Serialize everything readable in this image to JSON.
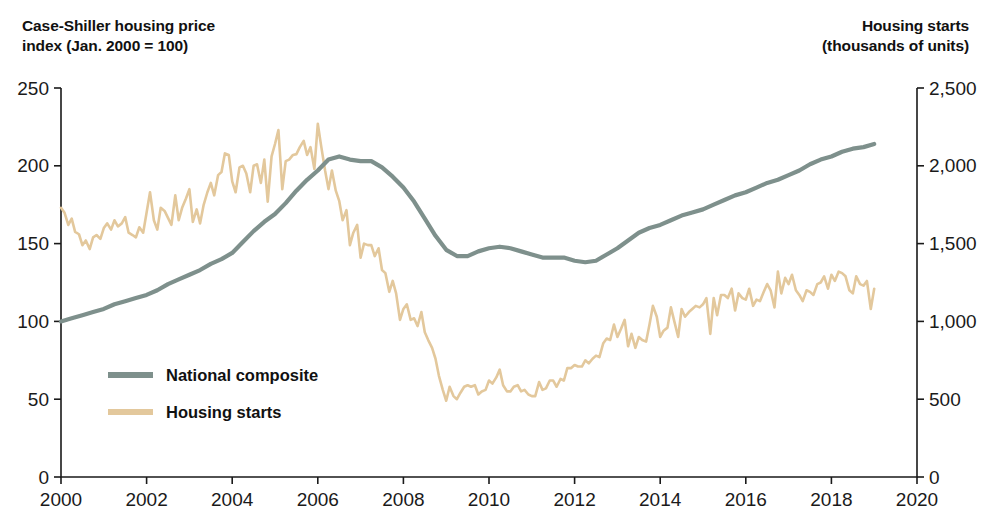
{
  "axis_titles": {
    "left": "Case-Shiller housing price\nindex (Jan. 2000 = 100)",
    "right": "Housing starts\n(thousands of units)"
  },
  "colors": {
    "national_composite": "#7e908c",
    "housing_starts": "#e3c89c",
    "axis": "#1a1a1a",
    "text": "#111111",
    "background": "#ffffff"
  },
  "legend": {
    "position": "inside-lower-left",
    "entries": [
      {
        "label": "National composite",
        "color": "#7e908c"
      },
      {
        "label": "Housing starts",
        "color": "#e3c89c"
      }
    ]
  },
  "chart_data": {
    "type": "line",
    "title": "",
    "subtitle": "",
    "xlabel": "",
    "grid": false,
    "xlim": [
      2000,
      2020
    ],
    "xticks": [
      2000,
      2002,
      2004,
      2006,
      2008,
      2010,
      2012,
      2014,
      2016,
      2018,
      2020
    ],
    "xticklabels": [
      "2000",
      "2002",
      "2004",
      "2006",
      "2008",
      "2010",
      "2012",
      "2014",
      "2016",
      "2018",
      "2020"
    ],
    "axes": [
      {
        "side": "left",
        "label": "Case-Shiller housing price index (Jan. 2000 = 100)",
        "ylim": [
          0,
          250
        ],
        "yticks": [
          0,
          50,
          100,
          150,
          200,
          250
        ],
        "yticklabels": [
          "0",
          "50",
          "100",
          "150",
          "200",
          "250"
        ]
      },
      {
        "side": "right",
        "label": "Housing starts (thousands of units)",
        "ylim": [
          0,
          2500
        ],
        "yticks": [
          0,
          500,
          1000,
          1500,
          2000,
          2500
        ],
        "yticklabels": [
          "0",
          "500",
          "1,000",
          "1,500",
          "2,000",
          "2,500"
        ]
      }
    ],
    "series": [
      {
        "name": "National composite",
        "axis": "left",
        "color": "#7e908c",
        "units": "index (Jan. 2000 = 100)",
        "x": [
          2000.0,
          2000.25,
          2000.5,
          2000.75,
          2001.0,
          2001.25,
          2001.5,
          2001.75,
          2002.0,
          2002.25,
          2002.5,
          2002.75,
          2003.0,
          2003.25,
          2003.5,
          2003.75,
          2004.0,
          2004.25,
          2004.5,
          2004.75,
          2005.0,
          2005.25,
          2005.5,
          2005.75,
          2006.0,
          2006.25,
          2006.5,
          2006.75,
          2007.0,
          2007.25,
          2007.5,
          2007.75,
          2008.0,
          2008.25,
          2008.5,
          2008.75,
          2009.0,
          2009.25,
          2009.5,
          2009.75,
          2010.0,
          2010.25,
          2010.5,
          2010.75,
          2011.0,
          2011.25,
          2011.5,
          2011.75,
          2012.0,
          2012.25,
          2012.5,
          2012.75,
          2013.0,
          2013.25,
          2013.5,
          2013.75,
          2014.0,
          2014.25,
          2014.5,
          2014.75,
          2015.0,
          2015.25,
          2015.5,
          2015.75,
          2016.0,
          2016.25,
          2016.5,
          2016.75,
          2017.0,
          2017.25,
          2017.5,
          2017.75,
          2018.0,
          2018.25,
          2018.5,
          2018.75,
          2019.0
        ],
        "y": [
          100,
          102,
          104,
          106,
          108,
          111,
          113,
          115,
          117,
          120,
          124,
          127,
          130,
          133,
          137,
          140,
          144,
          151,
          158,
          164,
          169,
          176,
          184,
          191,
          197,
          204,
          206,
          204,
          203,
          203,
          199,
          193,
          186,
          177,
          166,
          155,
          146,
          142,
          142,
          145,
          147,
          148,
          147,
          145,
          143,
          141,
          141,
          141,
          139,
          138,
          139,
          143,
          147,
          152,
          157,
          160,
          162,
          165,
          168,
          170,
          172,
          175,
          178,
          181,
          183,
          186,
          189,
          191,
          194,
          197,
          201,
          204,
          206,
          209,
          211,
          212,
          214
        ]
      },
      {
        "name": "Housing starts",
        "axis": "right",
        "color": "#e3c89c",
        "units": "thousands of units (SAAR, monthly)",
        "x": [
          2000.0,
          2000.08,
          2000.17,
          2000.25,
          2000.33,
          2000.42,
          2000.5,
          2000.58,
          2000.67,
          2000.75,
          2000.83,
          2000.92,
          2001.0,
          2001.08,
          2001.17,
          2001.25,
          2001.33,
          2001.42,
          2001.5,
          2001.58,
          2001.67,
          2001.75,
          2001.83,
          2001.92,
          2002.0,
          2002.08,
          2002.17,
          2002.25,
          2002.33,
          2002.42,
          2002.5,
          2002.58,
          2002.67,
          2002.75,
          2002.83,
          2002.92,
          2003.0,
          2003.08,
          2003.17,
          2003.25,
          2003.33,
          2003.42,
          2003.5,
          2003.58,
          2003.67,
          2003.75,
          2003.83,
          2003.92,
          2004.0,
          2004.08,
          2004.17,
          2004.25,
          2004.33,
          2004.42,
          2004.5,
          2004.58,
          2004.67,
          2004.75,
          2004.83,
          2004.92,
          2005.0,
          2005.08,
          2005.17,
          2005.25,
          2005.33,
          2005.42,
          2005.5,
          2005.58,
          2005.67,
          2005.75,
          2005.83,
          2005.92,
          2006.0,
          2006.08,
          2006.17,
          2006.25,
          2006.33,
          2006.42,
          2006.5,
          2006.58,
          2006.67,
          2006.75,
          2006.83,
          2006.92,
          2007.0,
          2007.08,
          2007.17,
          2007.25,
          2007.33,
          2007.42,
          2007.5,
          2007.58,
          2007.67,
          2007.75,
          2007.83,
          2007.92,
          2008.0,
          2008.08,
          2008.17,
          2008.25,
          2008.33,
          2008.42,
          2008.5,
          2008.58,
          2008.67,
          2008.75,
          2008.83,
          2008.92,
          2009.0,
          2009.08,
          2009.17,
          2009.25,
          2009.33,
          2009.42,
          2009.5,
          2009.58,
          2009.67,
          2009.75,
          2009.83,
          2009.92,
          2010.0,
          2010.08,
          2010.17,
          2010.25,
          2010.33,
          2010.42,
          2010.5,
          2010.58,
          2010.67,
          2010.75,
          2010.83,
          2010.92,
          2011.0,
          2011.08,
          2011.17,
          2011.25,
          2011.33,
          2011.42,
          2011.5,
          2011.58,
          2011.67,
          2011.75,
          2011.83,
          2011.92,
          2012.0,
          2012.08,
          2012.17,
          2012.25,
          2012.33,
          2012.42,
          2012.5,
          2012.58,
          2012.67,
          2012.75,
          2012.83,
          2012.92,
          2013.0,
          2013.08,
          2013.17,
          2013.25,
          2013.33,
          2013.42,
          2013.5,
          2013.58,
          2013.67,
          2013.75,
          2013.83,
          2013.92,
          2014.0,
          2014.08,
          2014.17,
          2014.25,
          2014.33,
          2014.42,
          2014.5,
          2014.58,
          2014.67,
          2014.75,
          2014.83,
          2014.92,
          2015.0,
          2015.08,
          2015.17,
          2015.25,
          2015.33,
          2015.42,
          2015.5,
          2015.58,
          2015.67,
          2015.75,
          2015.83,
          2015.92,
          2016.0,
          2016.08,
          2016.17,
          2016.25,
          2016.33,
          2016.42,
          2016.5,
          2016.58,
          2016.67,
          2016.75,
          2016.83,
          2016.92,
          2017.0,
          2017.08,
          2017.17,
          2017.25,
          2017.33,
          2017.42,
          2017.5,
          2017.58,
          2017.67,
          2017.75,
          2017.83,
          2017.92,
          2018.0,
          2018.08,
          2018.17,
          2018.25,
          2018.33,
          2018.42,
          2018.5,
          2018.58,
          2018.67,
          2018.75,
          2018.83,
          2018.92,
          2019.0
        ],
        "y": [
          1730,
          1700,
          1620,
          1660,
          1575,
          1560,
          1490,
          1520,
          1465,
          1540,
          1555,
          1530,
          1600,
          1630,
          1590,
          1650,
          1610,
          1630,
          1670,
          1570,
          1555,
          1540,
          1605,
          1570,
          1700,
          1830,
          1650,
          1590,
          1730,
          1710,
          1665,
          1620,
          1810,
          1650,
          1730,
          1790,
          1850,
          1640,
          1720,
          1630,
          1745,
          1830,
          1890,
          1810,
          1940,
          1960,
          2080,
          2070,
          1900,
          1830,
          1990,
          2000,
          1950,
          1830,
          2000,
          2010,
          1890,
          2040,
          1770,
          2060,
          2140,
          2230,
          1850,
          2030,
          2040,
          2070,
          2075,
          2120,
          2160,
          2070,
          2120,
          1980,
          2270,
          2125,
          1970,
          1850,
          1970,
          1840,
          1775,
          1650,
          1715,
          1490,
          1570,
          1620,
          1410,
          1500,
          1490,
          1490,
          1420,
          1470,
          1330,
          1310,
          1190,
          1260,
          1180,
          1010,
          1080,
          1110,
          1010,
          1020,
          970,
          1060,
          930,
          880,
          830,
          760,
          650,
          560,
          490,
          580,
          520,
          500,
          540,
          580,
          590,
          580,
          590,
          530,
          550,
          560,
          620,
          600,
          640,
          690,
          590,
          550,
          550,
          580,
          590,
          550,
          560,
          530,
          520,
          520,
          610,
          560,
          570,
          620,
          620,
          580,
          630,
          620,
          700,
          700,
          720,
          710,
          710,
          750,
          730,
          760,
          780,
          770,
          860,
          890,
          880,
          980,
          900,
          950,
          1010,
          840,
          920,
          830,
          900,
          880,
          870,
          980,
          1100,
          1030,
          900,
          940,
          960,
          1090,
          1000,
          900,
          1080,
          1030,
          1060,
          1080,
          1100,
          1090,
          1110,
          1150,
          920,
          1150,
          1040,
          1170,
          1170,
          1150,
          1210,
          1070,
          1180,
          1150,
          1140,
          1210,
          1100,
          1140,
          1130,
          1190,
          1240,
          1200,
          1090,
          1320,
          1180,
          1280,
          1240,
          1300,
          1200,
          1170,
          1130,
          1200,
          1190,
          1170,
          1240,
          1250,
          1290,
          1210,
          1300,
          1260,
          1320,
          1310,
          1290,
          1200,
          1180,
          1290,
          1240,
          1230,
          1260,
          1080,
          1210
        ]
      }
    ]
  }
}
